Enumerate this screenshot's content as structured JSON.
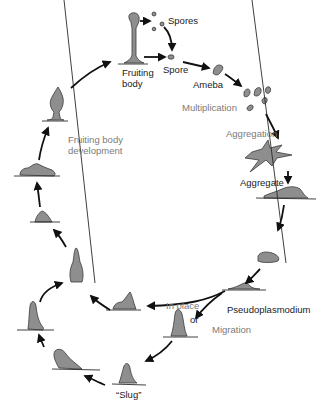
{
  "diagram": {
    "stages": {
      "spores": "Spores",
      "spore": "Spore",
      "ameba": "Ameba",
      "aggregate": "Aggregate",
      "pseudoplasmodium": "Pseudoplasmodium",
      "slug": "“Slug”",
      "fruiting_body_1": "Fruiting",
      "fruiting_body_2": "body"
    },
    "processes": {
      "multiplication": "Multiplication",
      "aggregation": "Aggregation",
      "in_place": "In place",
      "or": "or",
      "migration": "Migration",
      "fruiting_dev_1": "Fruiting body",
      "fruiting_dev_2": "development"
    },
    "colors": {
      "cell_fill": "#8e8e8e",
      "stage_label": "#1a1a1a",
      "process_label": "#7a7a7a"
    }
  }
}
